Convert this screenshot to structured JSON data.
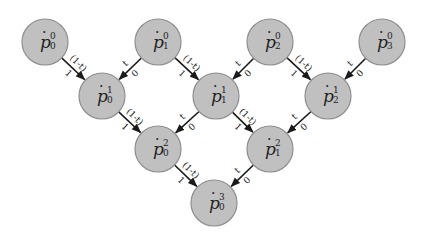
{
  "diagram": {
    "type": "de Casteljau / Bernstein triangle",
    "node_symbol": "ṗ",
    "nodes": [
      {
        "id": "p0_0",
        "base": "p",
        "sup": "0",
        "sub": "0",
        "x": 45,
        "y": 42
      },
      {
        "id": "p1_0",
        "base": "p",
        "sup": "0",
        "sub": "1",
        "x": 158,
        "y": 42
      },
      {
        "id": "p2_0",
        "base": "p",
        "sup": "0",
        "sub": "2",
        "x": 270,
        "y": 42
      },
      {
        "id": "p3_0",
        "base": "p",
        "sup": "0",
        "sub": "3",
        "x": 382,
        "y": 42
      },
      {
        "id": "p0_1",
        "base": "p",
        "sup": "1",
        "sub": "0",
        "x": 102,
        "y": 96
      },
      {
        "id": "p1_1",
        "base": "p",
        "sup": "1",
        "sub": "1",
        "x": 216,
        "y": 96
      },
      {
        "id": "p2_1",
        "base": "p",
        "sup": "1",
        "sub": "2",
        "x": 328,
        "y": 96
      },
      {
        "id": "p0_2",
        "base": "p",
        "sup": "2",
        "sub": "0",
        "x": 158,
        "y": 149
      },
      {
        "id": "p1_2",
        "base": "p",
        "sup": "2",
        "sub": "1",
        "x": 270,
        "y": 149
      },
      {
        "id": "p0_3",
        "base": "p",
        "sup": "3",
        "sub": "0",
        "x": 214,
        "y": 203
      }
    ],
    "edge_labels": {
      "right_down_top": "(1-t)",
      "right_down_bottom": "1",
      "left_down_top": "t",
      "left_down_bottom": "0"
    },
    "edges": [
      {
        "from": "p0_0",
        "to": "p0_1",
        "dir": "right"
      },
      {
        "from": "p1_0",
        "to": "p0_1",
        "dir": "left"
      },
      {
        "from": "p1_0",
        "to": "p1_1",
        "dir": "right"
      },
      {
        "from": "p2_0",
        "to": "p1_1",
        "dir": "left"
      },
      {
        "from": "p2_0",
        "to": "p2_1",
        "dir": "right"
      },
      {
        "from": "p3_0",
        "to": "p2_1",
        "dir": "left"
      },
      {
        "from": "p0_1",
        "to": "p0_2",
        "dir": "right"
      },
      {
        "from": "p1_1",
        "to": "p0_2",
        "dir": "left"
      },
      {
        "from": "p1_1",
        "to": "p1_2",
        "dir": "right"
      },
      {
        "from": "p2_1",
        "to": "p1_2",
        "dir": "left"
      },
      {
        "from": "p0_2",
        "to": "p0_3",
        "dir": "right"
      },
      {
        "from": "p1_2",
        "to": "p0_3",
        "dir": "left"
      }
    ],
    "colors": {
      "node_fill": "#c0c0c0",
      "node_stroke": "#8e8e8e",
      "edge": "#1a1a1a"
    }
  }
}
